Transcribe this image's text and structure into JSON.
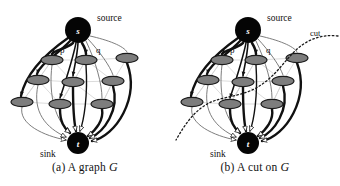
{
  "figure": {
    "panels": [
      {
        "id": "a",
        "caption_prefix": "(a) A graph ",
        "caption_symbol": "G",
        "caption_full": "(a) A graph G",
        "source_label": "s",
        "sink_label": "t",
        "source_text": "source",
        "sink_text": "sink",
        "node_labels": [
          "p",
          "q"
        ],
        "has_cut": false,
        "cut_label": ""
      },
      {
        "id": "b",
        "caption_prefix": "(b) A cut on ",
        "caption_symbol": "G",
        "caption_full": "(b) A cut on G",
        "source_label": "s",
        "sink_label": "t",
        "source_text": "source",
        "sink_text": "sink",
        "node_labels": [
          "p",
          "q"
        ],
        "has_cut": true,
        "cut_label": "cut"
      }
    ],
    "colors": {
      "background": "#ffffff",
      "terminal_fill": "#050505",
      "terminal_text": "#ffffff",
      "node_fill": "#7d7d7d",
      "node_stroke": "#1a1a1a",
      "edge_strong": "#111111",
      "edge_thin": "#6e6e6e",
      "lattice": "#d2d2d2",
      "cut_line": "#1a1a1a",
      "caption_text": "#121212"
    },
    "graph": {
      "terminals": [
        {
          "name": "source",
          "label": "s",
          "cx": 78,
          "cy": 30,
          "r": 13
        },
        {
          "name": "sink",
          "label": "t",
          "cx": 78,
          "cy": 143,
          "r": 11
        }
      ],
      "nodes": [
        {
          "id": "n0",
          "cx": 22,
          "cy": 102,
          "rx": 11,
          "ry": 4.6
        },
        {
          "id": "n1",
          "cx": 38,
          "cy": 80,
          "rx": 11,
          "ry": 4.6
        },
        {
          "id": "n2",
          "cx": 52,
          "cy": 60,
          "rx": 11,
          "ry": 4.6,
          "label": "p"
        },
        {
          "id": "n3",
          "cx": 60,
          "cy": 104,
          "rx": 11,
          "ry": 4.6
        },
        {
          "id": "n4",
          "cx": 73,
          "cy": 82,
          "rx": 11,
          "ry": 4.6
        },
        {
          "id": "n5",
          "cx": 86,
          "cy": 60,
          "rx": 11,
          "ry": 4.6,
          "label": "q"
        },
        {
          "id": "n6",
          "cx": 102,
          "cy": 104,
          "rx": 11,
          "ry": 4.6
        },
        {
          "id": "n7",
          "cx": 113,
          "cy": 81,
          "rx": 11,
          "ry": 4.6
        },
        {
          "id": "n8",
          "cx": 127,
          "cy": 58,
          "rx": 11,
          "ry": 4.6
        }
      ]
    }
  }
}
